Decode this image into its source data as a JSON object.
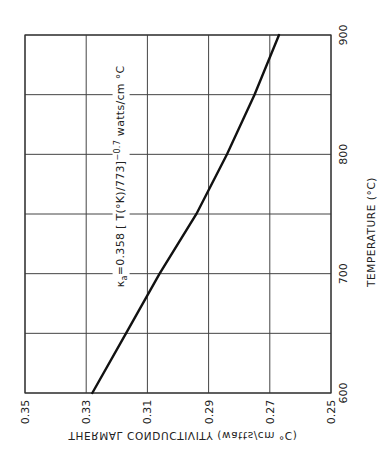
{
  "chart_data": {
    "type": "line",
    "title": "",
    "orientation": "rotated 90°: temperature runs along the vertical axis (600 at bottom, 900 at top); conductivity along the horizontal axis (0.35 at left, 0.25 at right)",
    "xlabel": "THERMAL CONDUCTIVITY (watts/cm °C)",
    "ylabel": "TEMPERATURE (°C)",
    "conductivity_axis": {
      "label": "THERMAL CONDUCTIVITY (watts/cm °C)",
      "ticks": [
        "0.35",
        "0.33",
        "0.31",
        "0.29",
        "0.27",
        "0.25"
      ],
      "range": [
        0.35,
        0.25
      ]
    },
    "temperature_axis": {
      "label": "TEMPERATURE (°C)",
      "ticks": [
        "600",
        "700",
        "800",
        "900"
      ],
      "range": [
        600,
        900
      ],
      "minor_gridlines_every": 50
    },
    "grid": true,
    "legend": null,
    "annotation": {
      "symbol": "κ",
      "subscript": "a",
      "text": "= 0.358  [ T(°K) / 773 ]",
      "exponent": "−0.7",
      "units": "watts/cm °C"
    },
    "series": [
      {
        "name": "κa",
        "x_temperature_C": [
          600,
          650,
          700,
          750,
          800,
          850,
          900
        ],
        "y_conductivity": [
          0.328,
          0.317,
          0.306,
          0.294,
          0.284,
          0.275,
          0.267
        ]
      }
    ]
  },
  "labels": {
    "formula_kappa": "κ",
    "formula_sub": "a",
    "formula_main": "=0.358  [ T(°K)/773]",
    "formula_exp": "−0.7",
    "formula_units": "watts/cm °C"
  }
}
